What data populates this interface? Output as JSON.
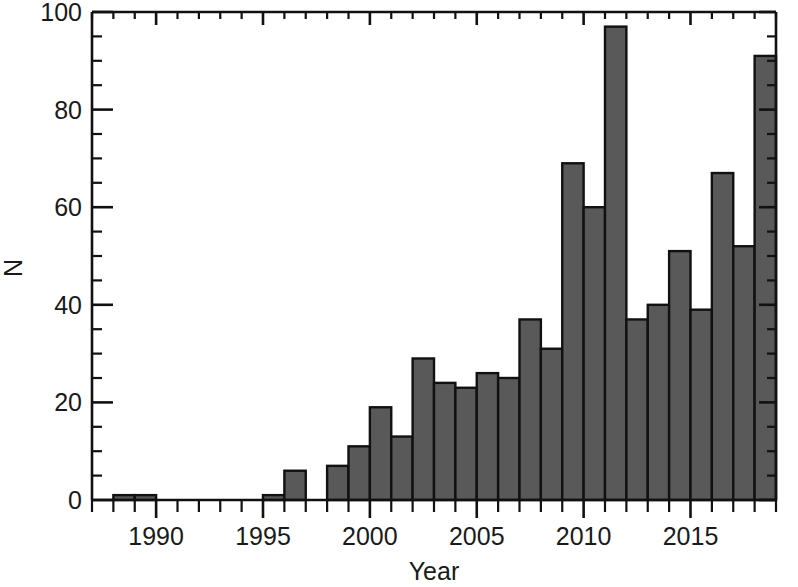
{
  "figure": {
    "name": "publication-count-histogram",
    "background_color": "#ffffff",
    "bar_fill_color": "#595959",
    "bar_edge_color": "#111111",
    "axis_color": "#111111"
  },
  "chart_data": {
    "type": "bar",
    "title": "",
    "subtitle": "",
    "xlabel": "Year",
    "ylabel": "N",
    "xlim": [
      1987,
      2019
    ],
    "ylim": [
      0,
      100
    ],
    "grid": false,
    "legend": null,
    "x_major_ticks": [
      1990,
      1995,
      2000,
      2005,
      2010,
      2015
    ],
    "x_major_tick_labels": [
      "1990",
      "1995",
      "2000",
      "2005",
      "2010",
      "2015"
    ],
    "x_minor_tick_interval": 1,
    "y_major_ticks": [
      0,
      20,
      40,
      60,
      80,
      100
    ],
    "y_major_tick_labels": [
      "0",
      "20",
      "40",
      "60",
      "80",
      "100"
    ],
    "y_minor_tick_interval": 5,
    "ticks_direction": "in-out",
    "bar_width_years": 1,
    "categories": [
      "1987",
      "1988",
      "1989",
      "1990",
      "1991",
      "1992",
      "1993",
      "1994",
      "1995",
      "1996",
      "1997",
      "1998",
      "1999",
      "2000",
      "2001",
      "2002",
      "2003",
      "2004",
      "2005",
      "2006",
      "2007",
      "2008",
      "2009",
      "2010",
      "2011",
      "2012",
      "2013",
      "2014",
      "2015",
      "2016",
      "2017",
      "2018"
    ],
    "values": [
      0,
      1,
      1,
      0,
      0,
      0,
      0,
      0,
      1,
      6,
      0,
      7,
      11,
      19,
      13,
      29,
      24,
      23,
      26,
      25,
      37,
      31,
      69,
      60,
      97,
      37,
      40,
      51,
      39,
      67,
      52,
      91
    ],
    "values_label": "N",
    "annotations": []
  }
}
